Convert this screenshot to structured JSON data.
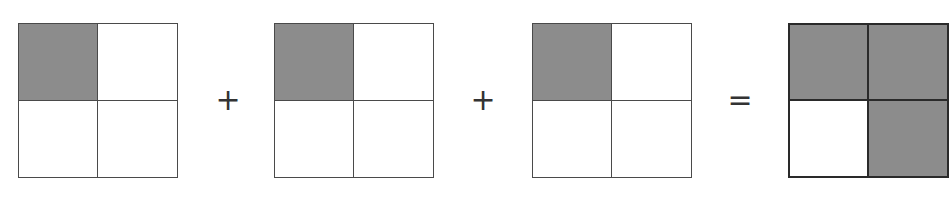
{
  "diagram": {
    "colors": {
      "shaded": "#8c8c8c",
      "unshaded": "#ffffff",
      "border": "#4a4a4a"
    },
    "grids": [
      {
        "id": "grid-1",
        "cells": [
          true,
          false,
          false,
          false
        ]
      },
      {
        "id": "grid-2",
        "cells": [
          true,
          false,
          false,
          false
        ]
      },
      {
        "id": "grid-3",
        "cells": [
          true,
          false,
          false,
          false
        ]
      },
      {
        "id": "grid-result",
        "cells": [
          true,
          true,
          false,
          true
        ]
      }
    ],
    "operators": {
      "plus_1": "+",
      "plus_2": "+",
      "equals": "="
    }
  }
}
